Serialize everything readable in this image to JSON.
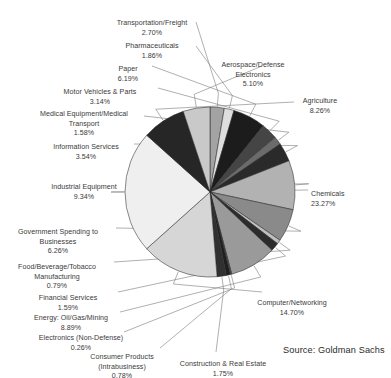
{
  "chart_data": {
    "type": "pie",
    "title": "",
    "source": "Source: Goldman Sachs",
    "center": [
      210,
      192
    ],
    "radius": 85,
    "start_angle_deg": 0,
    "direction": "clockwise",
    "legend": "none (direct labels with leader lines)",
    "units": "percent",
    "categories": [
      "Aerospace/Defense Electronics",
      "Agriculture",
      "Chemicals",
      "Computer/Networking",
      "Construction & Real Estate",
      "Consumer Products (Intrabusiness)",
      "Electronics (Non-Defense)",
      "Energy: Oil/Gas/Mining",
      "Financial Services",
      "Food/Beverage/Tobacco Manufacturing",
      "Government Spending to Businesses",
      "Industrial Equipment",
      "Information Services",
      "Medical Equipment/Medical Transport",
      "Motor Vehicles & Parts",
      "Paper",
      "Pharmaceuticals",
      "Transportation/Freight"
    ],
    "values": [
      5.1,
      8.26,
      23.27,
      14.7,
      1.75,
      0.78,
      0.26,
      8.89,
      1.59,
      0.79,
      6.26,
      9.34,
      3.54,
      1.58,
      3.14,
      6.19,
      1.86,
      2.7
    ],
    "colors": [
      "#c9c9c9",
      "#262626",
      "#efefef",
      "#d6d6d6",
      "#303030",
      "#1f1f1f",
      "#5a5a5a",
      "#9a9a9a",
      "#2c2c2c",
      "#bfbfbf",
      "#8a8a8a",
      "#b2b2b2",
      "#2a2a2a",
      "#6b6b6b",
      "#454545",
      "#1c1c1c",
      "#dedede",
      "#a3a3a3"
    ],
    "slices": [
      {
        "label": "Transportation/Freight",
        "pct": "2.70%",
        "value": 2.7,
        "color": "#a3a3a3"
      },
      {
        "label": "Pharmaceuticals",
        "pct": "1.86%",
        "value": 1.86,
        "color": "#dedede"
      },
      {
        "label": "Paper",
        "pct": "6.19%",
        "value": 6.19,
        "color": "#1c1c1c"
      },
      {
        "label": "Motor Vehicles & Parts",
        "pct": "3.14%",
        "value": 3.14,
        "color": "#454545"
      },
      {
        "label": "Medical Equipment/Medical Transport",
        "pct": "1.58%",
        "value": 1.58,
        "color": "#6b6b6b"
      },
      {
        "label": "Information Services",
        "pct": "3.54%",
        "value": 3.54,
        "color": "#2a2a2a"
      },
      {
        "label": "Industrial Equipment",
        "pct": "9.34%",
        "value": 9.34,
        "color": "#b2b2b2"
      },
      {
        "label": "Government Spending to Businesses",
        "pct": "6.26%",
        "value": 6.26,
        "color": "#8a8a8a"
      },
      {
        "label": "Food/Beverage/Tobacco Manufacturing",
        "pct": "0.79%",
        "value": 0.79,
        "color": "#bfbfbf"
      },
      {
        "label": "Financial Services",
        "pct": "1.59%",
        "value": 1.59,
        "color": "#2c2c2c"
      },
      {
        "label": "Energy: Oil/Gas/Mining",
        "pct": "8.89%",
        "value": 8.89,
        "color": "#9a9a9a"
      },
      {
        "label": "Electronics (Non-Defense)",
        "pct": "0.26%",
        "value": 0.26,
        "color": "#5a5a5a"
      },
      {
        "label": "Consumer Products (Intrabusiness)",
        "pct": "0.78%",
        "value": 0.78,
        "color": "#1f1f1f"
      },
      {
        "label": "Construction & Real Estate",
        "pct": "1.75%",
        "value": 1.75,
        "color": "#303030"
      },
      {
        "label": "Computer/Networking",
        "pct": "14.70%",
        "value": 14.7,
        "color": "#d6d6d6"
      },
      {
        "label": "Chemicals",
        "pct": "23.27%",
        "value": 23.27,
        "color": "#efefef"
      },
      {
        "label": "Agriculture",
        "pct": "8.26%",
        "value": 8.26,
        "color": "#262626"
      },
      {
        "label": "Aerospace/Defense Electronics",
        "pct": "5.10%",
        "value": 5.1,
        "color": "#c9c9c9"
      }
    ]
  },
  "labels": {
    "transportation_freight": {
      "name": "Transportation/Freight",
      "pct": "2.70%"
    },
    "pharmaceuticals": {
      "name": "Pharmaceuticals",
      "pct": "1.86%"
    },
    "paper": {
      "name": "Paper",
      "pct": "6.19%"
    },
    "motor_vehicles": {
      "name": "Motor Vehicles & Parts",
      "pct": "3.14%"
    },
    "medical_equipment": {
      "name": "Medical Equipment/Medical\nTransport",
      "pct": "1.58%"
    },
    "information_services": {
      "name": "Information Services",
      "pct": "3.54%"
    },
    "industrial_equipment": {
      "name": "Industrial Equipment",
      "pct": "9.34%"
    },
    "government_spending": {
      "name": "Government Spending to\nBusinesses",
      "pct": "6.26%"
    },
    "food_beverage": {
      "name": "Food/Beverage/Tobacco\nManufacturing",
      "pct": "0.79%"
    },
    "financial_services": {
      "name": "Financial Services",
      "pct": "1.59%"
    },
    "energy": {
      "name": "Energy: Oil/Gas/Mining",
      "pct": "8.89%"
    },
    "electronics_nondefense": {
      "name": "Electronics (Non-Defense)",
      "pct": "0.26%"
    },
    "consumer_products": {
      "name": "Consumer Products\n(Intrabusiness)",
      "pct": "0.78%"
    },
    "construction": {
      "name": "Construction & Real Estate",
      "pct": "1.75%"
    },
    "computer_networking": {
      "name": "Computer/Networking",
      "pct": "14.70%"
    },
    "chemicals": {
      "name": "Chemicals",
      "pct": "23.27%"
    },
    "agriculture": {
      "name": "Agriculture",
      "pct": "8.26%"
    },
    "aerospace_defense": {
      "name": "Aerospace/Defense\nElectronics",
      "pct": "5.10%"
    }
  },
  "source": {
    "text": "Source: Goldman Sachs"
  }
}
